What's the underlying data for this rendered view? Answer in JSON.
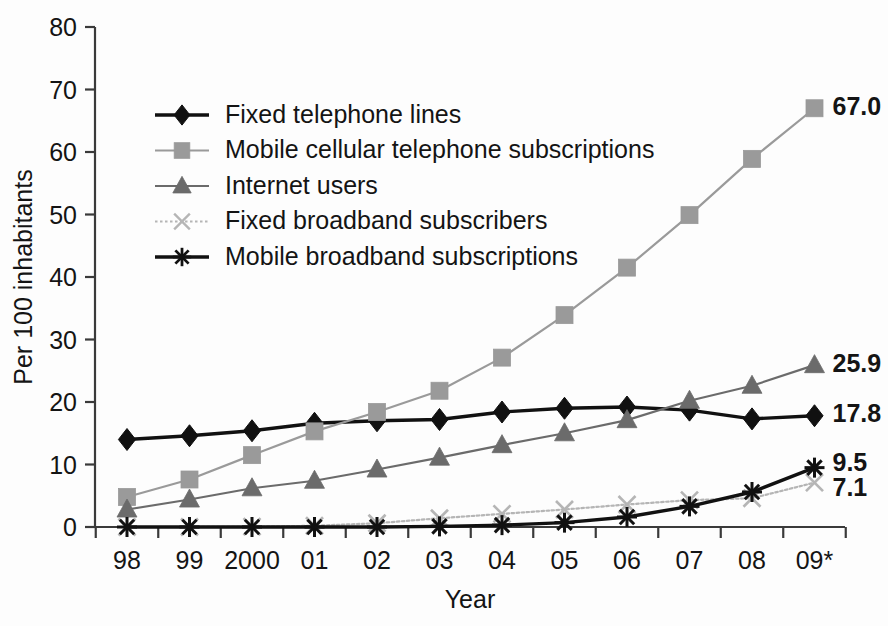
{
  "chart_data": {
    "type": "line",
    "title": "",
    "xlabel": "Year",
    "ylabel": "Per 100 inhabitants",
    "ylim": [
      0,
      80
    ],
    "ytick_values": [
      0,
      10,
      20,
      30,
      40,
      50,
      60,
      70,
      80
    ],
    "ytick_labels": [
      "0",
      "10",
      "20",
      "30",
      "40",
      "50",
      "60",
      "70",
      "80"
    ],
    "categories": [
      "98",
      "99",
      "2000",
      "01",
      "02",
      "03",
      "04",
      "05",
      "06",
      "07",
      "08",
      "09*"
    ],
    "grid": false,
    "legend_position": "upper-left-inside",
    "series": [
      {
        "name": "Fixed telephone lines",
        "marker": "diamond",
        "color": "#111111",
        "line_style": "solid",
        "values": [
          14.0,
          14.6,
          15.4,
          16.6,
          17.0,
          17.2,
          18.4,
          19.0,
          19.2,
          18.7,
          17.3,
          17.8
        ],
        "end_label": "17.8"
      },
      {
        "name": "Mobile cellular telephone subscriptions",
        "marker": "square",
        "color": "#9a9a9a",
        "line_style": "solid",
        "values": [
          4.8,
          7.6,
          11.5,
          15.3,
          18.4,
          21.8,
          27.1,
          33.9,
          41.5,
          49.9,
          58.9,
          67.0
        ],
        "end_label": "67.0"
      },
      {
        "name": "Internet users",
        "marker": "triangle",
        "color": "#6b6b6b",
        "line_style": "solid",
        "values": [
          2.8,
          4.4,
          6.2,
          7.4,
          9.2,
          11.1,
          13.1,
          15.0,
          17.1,
          20.2,
          22.6,
          25.9
        ],
        "end_label": "25.9"
      },
      {
        "name": "Fixed broadband subscribers",
        "marker": "x",
        "color": "#b5b5b5",
        "line_style": "dotted",
        "values": [
          0.0,
          0.0,
          0.05,
          0.2,
          0.6,
          1.4,
          2.1,
          2.8,
          3.6,
          4.3,
          4.6,
          7.1
        ],
        "end_label": "7.1"
      },
      {
        "name": "Mobile broadband subscriptions",
        "marker": "asterisk",
        "color": "#111111",
        "line_style": "solid",
        "values": [
          0.0,
          0.0,
          0.0,
          0.0,
          0.0,
          0.1,
          0.3,
          0.7,
          1.6,
          3.3,
          5.6,
          9.5
        ],
        "end_label": "9.5"
      }
    ]
  },
  "axes": {
    "x_title": "Year",
    "y_title": "Per 100 inhabitants"
  }
}
